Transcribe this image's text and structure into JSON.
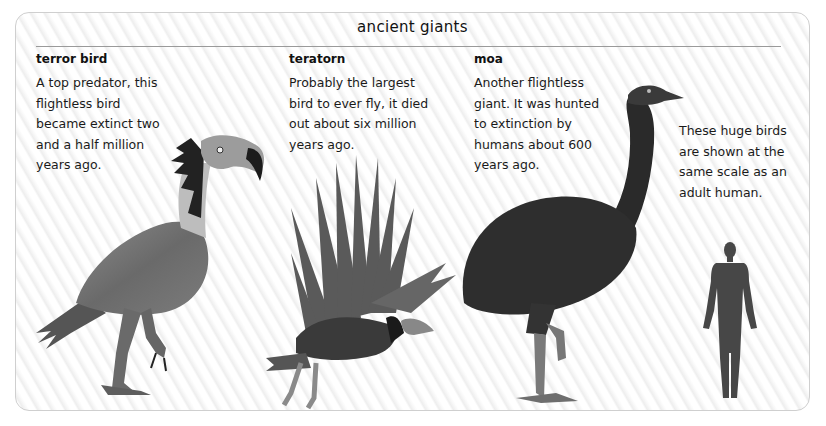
{
  "page": {
    "title": "ancient giants",
    "sections": [
      {
        "heading": "terror bird",
        "lines": [
          "A top predator, this",
          "flightless bird",
          "became extinct two",
          "and a half million",
          "years ago."
        ]
      },
      {
        "heading": "teratorn",
        "lines": [
          "Probably the largest",
          "bird to ever fly, it died",
          "out about six million",
          "years ago."
        ]
      },
      {
        "heading": "moa",
        "lines": [
          "Another flightless",
          "giant. It was hunted",
          "to extinction by",
          "humans about 600",
          "years ago."
        ]
      }
    ],
    "scale_note": {
      "lines": [
        "These huge birds",
        "are shown at the",
        "same scale as an",
        "adult human."
      ]
    },
    "illustrations": [
      {
        "subject": "terror-bird",
        "icon": "terror-bird-illustration"
      },
      {
        "subject": "teratorn",
        "icon": "teratorn-illustration"
      },
      {
        "subject": "moa",
        "icon": "moa-illustration"
      },
      {
        "subject": "adult-human",
        "icon": "human-silhouette-icon"
      }
    ],
    "colors": {
      "text": "#1a1a1a",
      "rule": "#9a9a9a",
      "border": "#cfcfcf",
      "bird_body": "#6f6f6f",
      "moa_body": "#2e2e2e",
      "human": "#474747"
    }
  }
}
